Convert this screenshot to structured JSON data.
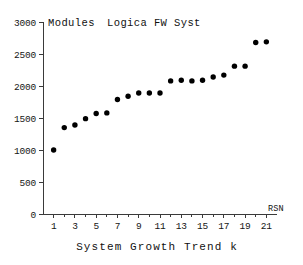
{
  "chart_data": {
    "type": "scatter",
    "title": "Modules   Logica FW Syst",
    "title_left": "Modules",
    "title_right": "Logica FW Syst",
    "xlabel": "System Growth Trend k",
    "ylabel": "Modules",
    "x_axis_name": "RSN",
    "x": [
      1,
      2,
      3,
      4,
      5,
      6,
      7,
      8,
      9,
      10,
      11,
      12,
      13,
      14,
      15,
      16,
      17,
      18,
      19,
      20,
      21
    ],
    "values": [
      1000,
      1350,
      1390,
      1490,
      1570,
      1580,
      1790,
      1840,
      1890,
      1890,
      1890,
      2080,
      2090,
      2080,
      2090,
      2140,
      2170,
      2310,
      2310,
      2680,
      2690
    ],
    "xlim": [
      0,
      22
    ],
    "ylim": [
      0,
      3000
    ],
    "yticks": [
      0,
      500,
      1000,
      1500,
      2000,
      2500,
      3000
    ],
    "ytick_labels": [
      "0",
      "500",
      "1000",
      "1500",
      "2000",
      "2500",
      "3000"
    ],
    "xticks": [
      1,
      3,
      5,
      7,
      9,
      11,
      13,
      15,
      17,
      19,
      21
    ],
    "xtick_labels": [
      "1",
      "3",
      "5",
      "7",
      "9",
      "11",
      "13",
      "15",
      "17",
      "19",
      "21"
    ],
    "grid": false,
    "legend": "none",
    "marker_color": "#000000",
    "axis_color": "#3a3a3a",
    "background": "#ffffff"
  }
}
